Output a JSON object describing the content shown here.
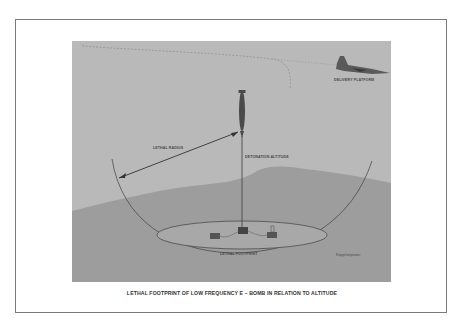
{
  "diagram": {
    "caption": "LETHAL FOOTPRINT OF LOW FREQUENCY E – BOMB IN RELATION TO ALTITUDE",
    "labels": {
      "delivery_platform": "DELIVERY PLATFORM",
      "lethal_radius": "LETHAL RADIUS",
      "detonation_altitude": "DETONATION ALTITUDE",
      "lethal_footprint": "LETHAL FOOTPRINT",
      "credit": "Kopp/airpower"
    },
    "colors": {
      "sky": "#b9b9b9",
      "ground": "#9a9a9a",
      "lines": "#3a3a3a",
      "frame": "#7a7a7a"
    }
  }
}
